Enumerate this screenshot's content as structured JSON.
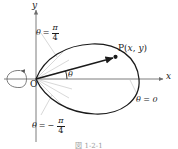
{
  "figure": {
    "type": "polar-curve-diagram",
    "caption": "図 1-2-1",
    "background": "#ffffff",
    "stroke_color": "#1a1a1a",
    "axis_color": "#6e6e6e",
    "guide_color": "#b0b0b0"
  },
  "axes": {
    "x_label": "x",
    "y_label": "y",
    "origin_label": "O"
  },
  "labels": {
    "theta_positive": {
      "theta": "θ",
      "equals": "=",
      "numerator": "π",
      "denominator": "4",
      "negative": false
    },
    "theta_negative": {
      "theta": "θ",
      "equals": "=",
      "minus": "−",
      "numerator": "π",
      "denominator": "4",
      "negative": true
    },
    "theta_zero": "θ = 0",
    "angle_theta": "θ",
    "point_p": {
      "name": "P",
      "open_paren": "(",
      "x": "x",
      "comma": ",",
      "y": "y",
      "close_paren": ")"
    }
  },
  "geometry": {
    "origin": {
      "x": 36,
      "y": 79
    },
    "point_p": {
      "x": 115,
      "y": 57
    },
    "curve_right_extent": {
      "x": 139,
      "y": 79
    },
    "ray_angle_deg": 16,
    "guide_rays_deg": [
      45,
      30,
      15,
      -15,
      -30,
      -45
    ]
  }
}
